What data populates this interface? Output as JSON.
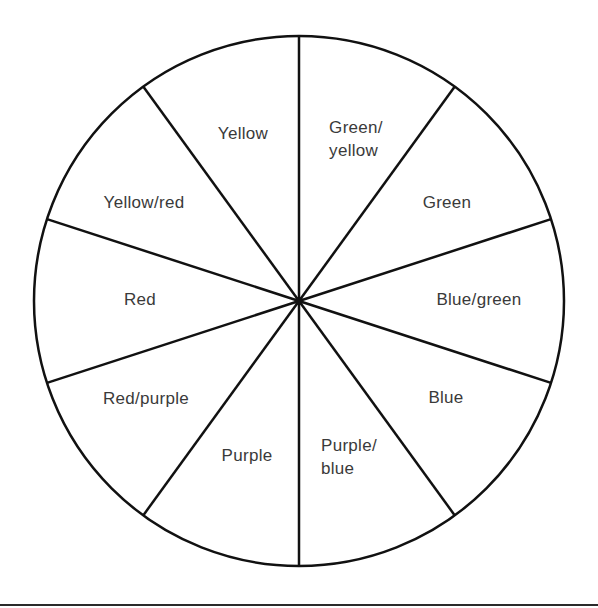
{
  "diagram": {
    "type": "color-wheel",
    "segment_count": 10,
    "colors": {
      "line": "#111111",
      "text": "#3a3a3a",
      "background": "#ffffff"
    },
    "segments": [
      {
        "label": "Green/\nyellow",
        "x": 356,
        "y": 139
      },
      {
        "label": "Green",
        "x": 447,
        "y": 202
      },
      {
        "label": "Blue/green",
        "x": 479,
        "y": 299
      },
      {
        "label": "Blue",
        "x": 446,
        "y": 397
      },
      {
        "label": "Purple/\nblue",
        "x": 349,
        "y": 457
      },
      {
        "label": "Purple",
        "x": 247,
        "y": 455
      },
      {
        "label": "Red/purple",
        "x": 146,
        "y": 398
      },
      {
        "label": "Red",
        "x": 140,
        "y": 299
      },
      {
        "label": "Yellow/red",
        "x": 144,
        "y": 202
      },
      {
        "label": "Yellow",
        "x": 243,
        "y": 133
      }
    ]
  }
}
